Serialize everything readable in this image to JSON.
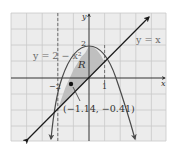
{
  "figure": {
    "curves": {
      "parabola_label": "y = 2 − x²",
      "line_label": "y = x"
    },
    "region_label": "R",
    "point": {
      "x": -1.14,
      "y": -0.41,
      "label": "(−1.14, −0.41)"
    },
    "axes": {
      "x_label": "x",
      "y_label": "y",
      "ticks": {
        "x_neg2": "−2",
        "x_1": "1",
        "y_2": "2"
      }
    },
    "intersections": [
      {
        "x": -2,
        "y": -2
      },
      {
        "x": 1,
        "y": 1
      }
    ],
    "colors": {
      "background": "#ececec",
      "grid": "#c9c9c9",
      "region": "#bfbfbf",
      "axis": "#333333",
      "curve": "#4a4a4a",
      "line": "#1a1a1a",
      "label_gray": "#6a6a6a"
    }
  }
}
